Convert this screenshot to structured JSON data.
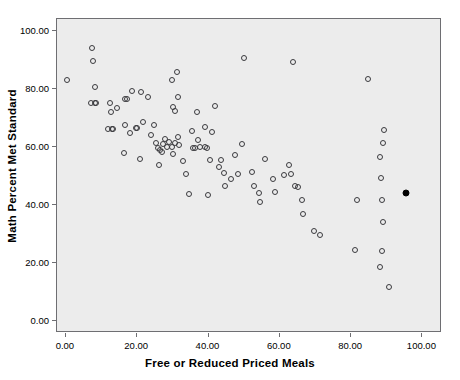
{
  "chart_data": {
    "type": "scatter",
    "title": "",
    "xlabel": "Free or Reduced Priced Meals",
    "ylabel": "Math Percent Met Standard",
    "xlim": [
      -2.5,
      105.5
    ],
    "ylim": [
      -4.0,
      104.0
    ],
    "xticks": [
      0,
      20,
      40,
      60,
      80,
      100
    ],
    "xticklabels": [
      "0.00",
      "20.00",
      "40.00",
      "60.00",
      "80.00",
      "100.00"
    ],
    "yticks": [
      0,
      20,
      40,
      60,
      80,
      100
    ],
    "yticklabels": [
      "0.00",
      "20.00",
      "40.00",
      "60.00",
      "80.00",
      "100.00"
    ],
    "grid": false,
    "legend": null,
    "marker": "open-circle",
    "marker_color": "#3a3a3e",
    "plot_background": "#ececec",
    "frame_color": "#6e6e72",
    "series": [
      {
        "name": "schools",
        "style": "open-circle",
        "points": [
          [
            0.6,
            82.6
          ],
          [
            7.5,
            93.6
          ],
          [
            7.8,
            89.2
          ],
          [
            8.4,
            80.4
          ],
          [
            7.2,
            74.8
          ],
          [
            8.4,
            74.8
          ],
          [
            8.7,
            74.9
          ],
          [
            12.7,
            74.9
          ],
          [
            13.0,
            71.7
          ],
          [
            14.5,
            73.0
          ],
          [
            12.1,
            65.8
          ],
          [
            13.3,
            65.7
          ],
          [
            13.6,
            65.7
          ],
          [
            16.8,
            67.1
          ],
          [
            18.2,
            64.6
          ],
          [
            16.5,
            57.6
          ],
          [
            16.9,
            76.1
          ],
          [
            17.3,
            76.2
          ],
          [
            18.8,
            79.0
          ],
          [
            21.4,
            78.4
          ],
          [
            23.4,
            76.9
          ],
          [
            19.9,
            66.2
          ],
          [
            20.2,
            66.3
          ],
          [
            22.0,
            68.2
          ],
          [
            21.1,
            55.5
          ],
          [
            24.1,
            63.6
          ],
          [
            24.9,
            67.2
          ],
          [
            25.5,
            61.0
          ],
          [
            26.5,
            53.4
          ],
          [
            26.0,
            59.2
          ],
          [
            26.8,
            58.6
          ],
          [
            27.2,
            57.9
          ],
          [
            27.6,
            60.5
          ],
          [
            28.2,
            62.3
          ],
          [
            28.6,
            59.6
          ],
          [
            29.3,
            61.3
          ],
          [
            29.9,
            59.5
          ],
          [
            30.4,
            57.3
          ],
          [
            30.9,
            61.1
          ],
          [
            31.6,
            63.1
          ],
          [
            32.0,
            60.2
          ],
          [
            31.0,
            72.0
          ],
          [
            30.3,
            73.5
          ],
          [
            31.8,
            77.0
          ],
          [
            30.1,
            82.7
          ],
          [
            31.5,
            85.5
          ],
          [
            33.0,
            54.7
          ],
          [
            33.9,
            50.5
          ],
          [
            34.9,
            43.4
          ],
          [
            35.6,
            65.2
          ],
          [
            36.0,
            59.3
          ],
          [
            36.5,
            59.4
          ],
          [
            37.2,
            62.0
          ],
          [
            37.8,
            59.8
          ],
          [
            37.0,
            71.8
          ],
          [
            39.2,
            59.6
          ],
          [
            39.8,
            59.4
          ],
          [
            39.4,
            66.4
          ],
          [
            40.0,
            43.2
          ],
          [
            40.6,
            55.3
          ],
          [
            41.2,
            64.9
          ],
          [
            42.0,
            73.8
          ],
          [
            43.2,
            52.9
          ],
          [
            43.7,
            55.1
          ],
          [
            44.5,
            50.8
          ],
          [
            45.0,
            46.3
          ],
          [
            46.5,
            48.6
          ],
          [
            47.8,
            56.9
          ],
          [
            48.6,
            50.4
          ],
          [
            49.7,
            60.7
          ],
          [
            50.2,
            90.3
          ],
          [
            52.4,
            51.0
          ],
          [
            53.0,
            46.2
          ],
          [
            54.5,
            43.8
          ],
          [
            56.0,
            55.6
          ],
          [
            54.8,
            40.6
          ],
          [
            58.5,
            48.5
          ],
          [
            59.0,
            44.3
          ],
          [
            61.5,
            49.9
          ],
          [
            63.0,
            53.5
          ],
          [
            63.5,
            50.2
          ],
          [
            64.6,
            46.2
          ],
          [
            64.0,
            88.8
          ],
          [
            65.5,
            45.8
          ],
          [
            66.5,
            41.5
          ],
          [
            66.8,
            36.5
          ],
          [
            70.0,
            30.7
          ],
          [
            71.5,
            29.5
          ],
          [
            81.5,
            24.2
          ],
          [
            82.0,
            41.5
          ],
          [
            85.0,
            83.0
          ],
          [
            88.5,
            18.5
          ],
          [
            89.0,
            24.0
          ],
          [
            89.3,
            34.0
          ],
          [
            89.0,
            41.5
          ],
          [
            88.8,
            48.8
          ],
          [
            88.5,
            56.2
          ],
          [
            89.2,
            60.9
          ],
          [
            89.4,
            65.5
          ],
          [
            91.0,
            11.5
          ]
        ]
      },
      {
        "name": "highlighted-school",
        "style": "filled-circle",
        "points": [
          [
            95.6,
            43.7
          ]
        ]
      }
    ]
  },
  "axes": {
    "x_title": "Free or Reduced Priced Meals",
    "y_title": "Math Percent Met Standard"
  }
}
